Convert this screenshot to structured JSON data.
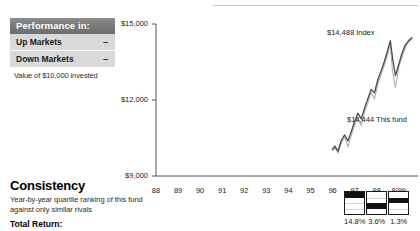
{
  "performance_panel": {
    "header": "Performance in:",
    "rows": [
      {
        "label": "Up Markets",
        "value": "–"
      },
      {
        "label": "Down Markets",
        "value": "–"
      }
    ],
    "note": "Value of $10,000 invested"
  },
  "consistency": {
    "title": "Consistency",
    "subtitle": "Year-by-year quartile ranking of this fund against only similar rivals",
    "total_return_label": "Total Return:"
  },
  "quartiles": {
    "items": [
      {
        "year": "97",
        "rank": 1,
        "value": "14.8%"
      },
      {
        "year": "98",
        "rank": 3,
        "value": "3.6%"
      },
      {
        "year": "8/99",
        "rank": 2,
        "value": "1.3%"
      }
    ]
  },
  "colors": {
    "fund_line": "#4a4a4a",
    "index_line": "#b0b0b0",
    "axis": "#555555",
    "panel_header_bg": "#787878",
    "panel_row_bg": "#d9d9d9"
  },
  "chart_data": {
    "type": "line",
    "title": "",
    "xlabel": "",
    "ylabel": "",
    "ylim": [
      9000,
      15000
    ],
    "yticks": [
      "$9,000",
      "$12,000",
      "$15,000"
    ],
    "ytick_values": [
      9000,
      12000,
      15000
    ],
    "grid": false,
    "legend": "annotations",
    "categories": [
      "88",
      "89",
      "90",
      "91",
      "92",
      "93",
      "94",
      "95",
      "96",
      "97",
      "98",
      "8/99"
    ],
    "annotations": [
      {
        "text": "$14,488 Index",
        "value": 14488,
        "series": "Index"
      },
      {
        "text": "$14,444 This fund",
        "value": 14444,
        "series": "This fund"
      }
    ],
    "series": [
      {
        "name": "This fund",
        "color": "#4a4a4a",
        "x": [
          96.0,
          96.1,
          96.25,
          96.4,
          96.55,
          96.7,
          96.85,
          97.0,
          97.15,
          97.3,
          97.45,
          97.6,
          97.75,
          97.9,
          98.05,
          98.2,
          98.35,
          98.5,
          98.62,
          98.72,
          98.85,
          99.0,
          99.15,
          99.3,
          99.45,
          99.6
        ],
        "values": [
          10050,
          10180,
          9980,
          10420,
          10620,
          10380,
          10760,
          11150,
          11480,
          11250,
          11680,
          12050,
          12420,
          12280,
          12800,
          13150,
          13520,
          13980,
          14340,
          13640,
          12960,
          13400,
          13860,
          14180,
          14320,
          14444
        ]
      },
      {
        "name": "Index",
        "color": "#b0b0b0",
        "x": [
          96.0,
          96.1,
          96.25,
          96.4,
          96.55,
          96.7,
          96.85,
          97.0,
          97.15,
          97.3,
          97.45,
          97.6,
          97.75,
          97.9,
          98.05,
          98.2,
          98.35,
          98.5,
          98.62,
          98.72,
          98.85,
          99.0,
          99.15,
          99.3,
          99.45,
          99.6
        ],
        "values": [
          10000,
          10120,
          9900,
          10300,
          10520,
          10150,
          10600,
          11000,
          11280,
          10980,
          11520,
          11880,
          12300,
          12040,
          12620,
          13000,
          13380,
          13820,
          14180,
          13120,
          12500,
          13280,
          13720,
          14050,
          14380,
          14488
        ]
      }
    ]
  }
}
